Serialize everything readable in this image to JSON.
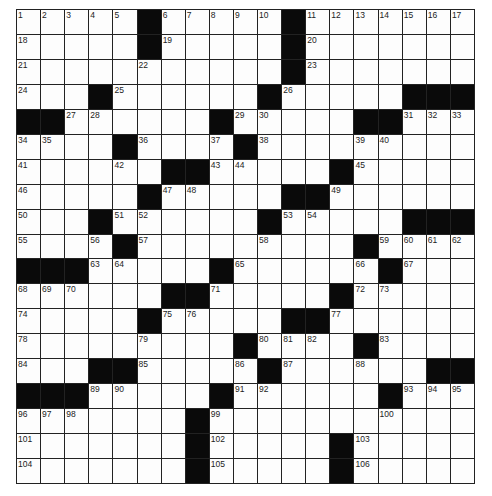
{
  "puzzle": {
    "type": "crossword",
    "rows": 19,
    "cols": 19,
    "colors": {
      "block": "#0a0a0a",
      "cell": "#fdfdfd",
      "line": "#222222"
    },
    "grid": [
      [
        "1",
        "2",
        "3",
        "4",
        "5",
        "#",
        "6",
        "7",
        "8",
        "9",
        "10",
        "#",
        "11",
        "12",
        "13",
        "14",
        "15",
        "16",
        "17"
      ],
      [
        "18",
        "",
        "",
        "",
        "",
        "#",
        "19",
        "",
        "",
        "",
        "",
        "#",
        "20",
        "",
        "",
        "",
        "",
        "",
        ""
      ],
      [
        "21",
        "",
        "",
        "",
        "",
        "22",
        "",
        "",
        "",
        "",
        "",
        "#",
        "23",
        "",
        "",
        "",
        "",
        "",
        ""
      ],
      [
        "24",
        "",
        "",
        "#",
        "25",
        "",
        "",
        "",
        "",
        "",
        "#",
        "26",
        "",
        "",
        "",
        "",
        "#",
        "#",
        "#"
      ],
      [
        "#",
        "#",
        "27",
        "28",
        "",
        "",
        "",
        "",
        "#",
        "29",
        "30",
        "",
        "",
        "",
        "#",
        "#",
        "31",
        "32",
        "33"
      ],
      [
        "34",
        "35",
        "",
        "",
        "#",
        "36",
        "",
        "",
        "37",
        "#",
        "38",
        "",
        "",
        "",
        "39",
        "40",
        "",
        "",
        ""
      ],
      [
        "41",
        "",
        "",
        "",
        "42",
        "",
        "#",
        "#",
        "43",
        "44",
        "",
        "",
        "",
        "#",
        "45",
        "",
        "",
        "",
        ""
      ],
      [
        "46",
        "",
        "",
        "",
        "",
        "#",
        "47",
        "48",
        "",
        "",
        "",
        "#",
        "#",
        "49",
        "",
        "",
        "",
        "",
        ""
      ],
      [
        "50",
        "",
        "",
        "#",
        "51",
        "52",
        "",
        "",
        "",
        "",
        "#",
        "53",
        "54",
        "",
        "",
        "",
        "#",
        "#",
        "#"
      ],
      [
        "55",
        "",
        "",
        "56",
        "#",
        "57",
        "",
        "",
        "",
        "",
        "58",
        "",
        "",
        "",
        "#",
        "59",
        "60",
        "61",
        "62"
      ],
      [
        "#",
        "#",
        "#",
        "63",
        "64",
        "",
        "",
        "",
        "#",
        "65",
        "",
        "",
        "",
        "",
        "66",
        "#",
        "67",
        "",
        ""
      ],
      [
        "68",
        "69",
        "70",
        "",
        "",
        "",
        "#",
        "#",
        "71",
        "",
        "",
        "",
        "",
        "#",
        "72",
        "73",
        "",
        "",
        ""
      ],
      [
        "74",
        "",
        "",
        "",
        "",
        "#",
        "75",
        "76",
        "",
        "",
        "",
        "#",
        "#",
        "77",
        "",
        "",
        "",
        "",
        ""
      ],
      [
        "78",
        "",
        "",
        "",
        "",
        "79",
        "",
        "",
        "",
        "#",
        "80",
        "81",
        "82",
        "",
        "#",
        "83",
        "",
        "",
        ""
      ],
      [
        "84",
        "",
        "",
        "#",
        "#",
        "85",
        "",
        "",
        "",
        "86",
        "#",
        "87",
        "",
        "",
        "88",
        "",
        "",
        "#",
        "#"
      ],
      [
        "#",
        "#",
        "#",
        "89",
        "90",
        "",
        "",
        "",
        "#",
        "91",
        "92",
        "",
        "",
        "",
        "",
        "#",
        "93",
        "94",
        "95"
      ],
      [
        "96",
        "97",
        "98",
        "",
        "",
        "",
        "",
        "#",
        "99",
        "",
        "",
        "",
        "",
        "",
        "",
        "100",
        "",
        "",
        ""
      ],
      [
        "101",
        "",
        "",
        "",
        "",
        "",
        "",
        "#",
        "102",
        "",
        "",
        "",
        "",
        "#",
        "103",
        "",
        "",
        "",
        ""
      ],
      [
        "104",
        "",
        "",
        "",
        "",
        "",
        "",
        "#",
        "105",
        "",
        "",
        "",
        "",
        "#",
        "106",
        "",
        "",
        "",
        ""
      ]
    ]
  }
}
